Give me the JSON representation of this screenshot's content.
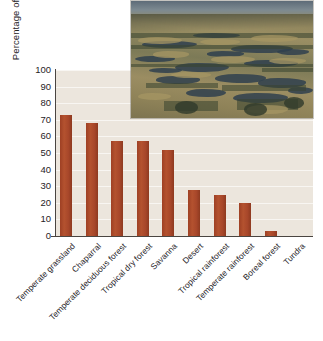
{
  "chart_data": {
    "type": "bar",
    "title": "",
    "subtitle": "",
    "xlabel": "",
    "ylabel": "Percentage of habitat lost",
    "ylim": [
      0,
      100
    ],
    "ytick_labels": [
      "100",
      "90",
      "80",
      "70",
      "60",
      "50",
      "40",
      "30",
      "20",
      "10",
      "0"
    ],
    "ytick_values": [
      100,
      90,
      80,
      70,
      60,
      50,
      40,
      30,
      20,
      10,
      0
    ],
    "grid": true,
    "legend": "none",
    "categories": [
      "Temperate grassland",
      "Chaparral",
      "Temperate deciduous forest",
      "Tropical dry forest",
      "Savanna",
      "Desert",
      "Tropical rainforest",
      "Temperate rainforest",
      "Boreal forest",
      "Tundra"
    ],
    "values": [
      73,
      68,
      57,
      57,
      52,
      28,
      25,
      20,
      3,
      0
    ],
    "bar_color": "#a8472a",
    "plot_background": "#ece6dd",
    "axis_color": "#4a4541"
  },
  "inset": {
    "name": "aerial-photograph-prairie-wetlands",
    "caption": ""
  }
}
